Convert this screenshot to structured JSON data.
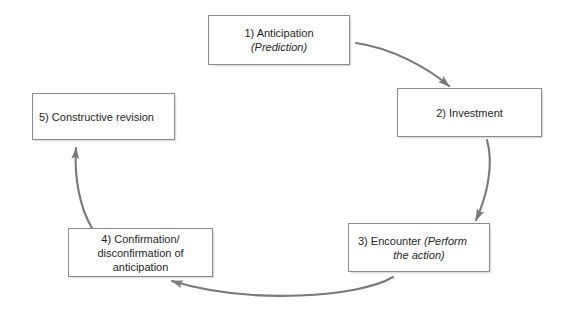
{
  "diagram": {
    "type": "cycle-flow",
    "colors": {
      "box_border": "#8c8c8c",
      "box_fill": "#ffffff",
      "arrow": "#787878",
      "text": "#262626",
      "background": "#ffffff"
    },
    "nodes": [
      {
        "id": "node-1",
        "number": "1)",
        "lines": [
          {
            "text": "1) Anticipation",
            "style": "normal"
          },
          {
            "text": "(Prediction)",
            "style": "italic"
          }
        ],
        "align": "center"
      },
      {
        "id": "node-2",
        "number": "2)",
        "lines": [
          {
            "text": "2) Investment",
            "style": "normal"
          }
        ],
        "align": "center"
      },
      {
        "id": "node-3",
        "number": "3)",
        "lines": [
          {
            "text": "3) Encounter ",
            "style": "normal"
          },
          {
            "text": "(Perform",
            "style": "italic"
          },
          {
            "text": "the action)",
            "style": "italic"
          }
        ],
        "align": "mixed"
      },
      {
        "id": "node-4",
        "number": "4)",
        "lines": [
          {
            "text": "4) Confirmation/",
            "style": "normal"
          },
          {
            "text": "disconfirmation of",
            "style": "normal"
          },
          {
            "text": "anticipation",
            "style": "normal"
          }
        ],
        "align": "center"
      },
      {
        "id": "node-5",
        "number": "5)",
        "lines": [
          {
            "text": "5) Constructive revision",
            "style": "normal"
          }
        ],
        "align": "left"
      }
    ],
    "edges": [
      {
        "id": "edge-1-2",
        "from": "node-1",
        "to": "node-2",
        "direction": "clockwise"
      },
      {
        "id": "edge-2-3",
        "from": "node-2",
        "to": "node-3",
        "direction": "clockwise"
      },
      {
        "id": "edge-3-4",
        "from": "node-3",
        "to": "node-4",
        "direction": "clockwise"
      },
      {
        "id": "edge-4-5",
        "from": "node-4",
        "to": "node-5",
        "direction": "clockwise"
      }
    ]
  }
}
